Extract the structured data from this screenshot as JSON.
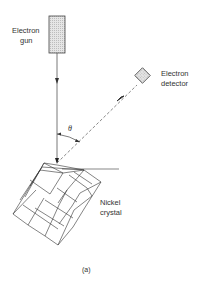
{
  "diagram": {
    "labels": {
      "electron_gun": [
        "Electron",
        "gun"
      ],
      "electron_detector": [
        "Electron",
        "detector"
      ],
      "nickel_crystal": [
        "Nickel",
        "crystal"
      ],
      "angle": "θ",
      "caption": "(a)"
    }
  }
}
